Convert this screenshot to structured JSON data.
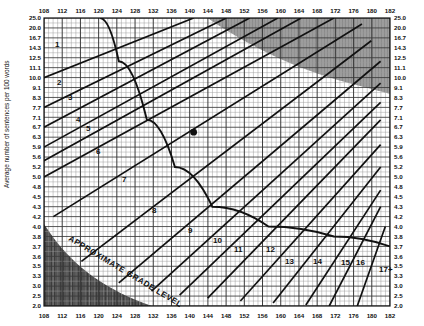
{
  "axes": {
    "y_label": "Average number of sentences per 100 words",
    "x_ticks": [
      "108",
      "112",
      "116",
      "120",
      "124",
      "128",
      "132",
      "136",
      "140",
      "144",
      "148",
      "152",
      "156",
      "160",
      "164",
      "168",
      "172",
      "176",
      "180",
      "182"
    ],
    "y_ticks": [
      "25.0",
      "20.0",
      "16.7",
      "14.3",
      "12.5",
      "11.1",
      "10.0",
      "9.1",
      "8.3",
      "7.7",
      "7.1",
      "6.7",
      "6.3",
      "5.9",
      "5.6",
      "5.2",
      "5.0",
      "4.8",
      "4.5",
      "4.3",
      "4.2",
      "4.0",
      "3.8",
      "3.7",
      "3.6",
      "3.5",
      "3.3",
      "3.0",
      "2.5",
      "2.0"
    ]
  },
  "grade_labels": [
    "1",
    "2",
    "3",
    "4",
    "5",
    "6",
    "7",
    "8",
    "9",
    "10",
    "11",
    "12",
    "13",
    "14",
    "15",
    "16",
    "17+"
  ],
  "diagonal_label": "APPROXIMATE GRADE LEVEL",
  "colors": {
    "ink": "#111111",
    "grid": "#555555",
    "grid_light": "#8d8d8d",
    "shade_top": "#8f8f8f",
    "shade_bottom": "#4a4a4a",
    "marker": "#111111",
    "background": "#ffffff"
  },
  "chart_data": {
    "type": "line",
    "xlabel": "",
    "ylabel": "Average number of sentences per 100 words",
    "xlim": [
      108,
      182
    ],
    "ylim": [
      2.0,
      25.0
    ],
    "grid": true,
    "legend": "none",
    "x_tick_values": [
      108,
      112,
      116,
      120,
      124,
      128,
      132,
      136,
      140,
      144,
      148,
      152,
      156,
      160,
      164,
      168,
      172,
      176,
      180,
      182
    ],
    "y_tick_values": [
      25.0,
      20.0,
      16.7,
      14.3,
      12.5,
      11.1,
      10.0,
      9.1,
      8.3,
      7.7,
      7.1,
      6.7,
      6.3,
      5.9,
      5.6,
      5.2,
      5.0,
      4.8,
      4.5,
      4.3,
      4.2,
      4.0,
      3.8,
      3.7,
      3.6,
      3.5,
      3.3,
      3.0,
      2.5,
      2.0
    ],
    "annotations": [
      {
        "text": "APPROXIMATE GRADE LEVEL",
        "orientation": "diagonal"
      }
    ],
    "series": [
      {
        "name": "grade-1",
        "label": "1",
        "values": [
          [
            108,
            10.0
          ],
          [
            140,
            25.0
          ]
        ]
      },
      {
        "name": "grade-2",
        "label": "2",
        "values": [
          [
            108,
            7.7
          ],
          [
            147,
            25.0
          ]
        ]
      },
      {
        "name": "grade-3",
        "label": "3",
        "values": [
          [
            108,
            6.7
          ],
          [
            152,
            25.0
          ]
        ]
      },
      {
        "name": "grade-4",
        "label": "4",
        "values": [
          [
            108,
            5.9
          ],
          [
            158,
            25.0
          ]
        ]
      },
      {
        "name": "grade-5",
        "label": "5",
        "values": [
          [
            108,
            5.45
          ],
          [
            163,
            25.0
          ]
        ]
      },
      {
        "name": "grade-6",
        "label": "6",
        "values": [
          [
            108,
            5.0
          ],
          [
            170,
            25.0
          ]
        ]
      },
      {
        "name": "grade-7",
        "label": "7",
        "values": [
          [
            110,
            4.2
          ],
          [
            176,
            22.0
          ]
        ]
      },
      {
        "name": "grade-8",
        "label": "8",
        "values": [
          [
            116,
            3.55
          ],
          [
            178,
            16.0
          ]
        ]
      },
      {
        "name": "grade-9",
        "label": "9",
        "values": [
          [
            124,
            3.1
          ],
          [
            180,
            12.0
          ]
        ]
      },
      {
        "name": "grade-10",
        "label": "10",
        "values": [
          [
            131,
            2.75
          ],
          [
            180,
            9.5
          ]
        ]
      },
      {
        "name": "grade-11",
        "label": "11",
        "values": [
          [
            137,
            2.55
          ],
          [
            180,
            8.0
          ]
        ]
      },
      {
        "name": "grade-12",
        "label": "12",
        "values": [
          [
            143,
            2.4
          ],
          [
            180,
            7.0
          ]
        ]
      },
      {
        "name": "grade-13",
        "label": "13",
        "values": [
          [
            150,
            2.25
          ],
          [
            180,
            6.0
          ]
        ]
      },
      {
        "name": "grade-14",
        "label": "14",
        "values": [
          [
            157,
            2.15
          ],
          [
            180,
            5.2
          ]
        ]
      },
      {
        "name": "grade-15",
        "label": "15",
        "values": [
          [
            164,
            2.05
          ],
          [
            180,
            4.7
          ]
        ]
      },
      {
        "name": "grade-16",
        "label": "16",
        "values": [
          [
            169,
            2.0
          ],
          [
            180,
            4.3
          ]
        ]
      },
      {
        "name": "grade-17",
        "label": "17+",
        "values": [
          [
            175,
            2.0
          ],
          [
            181,
            4.0
          ]
        ]
      }
    ],
    "boundary_curve": {
      "name": "long-word-boundary",
      "values": [
        [
          120,
          25.0
        ],
        [
          124,
          12.0
        ],
        [
          130,
          7.0
        ],
        [
          136,
          5.2
        ],
        [
          144,
          4.3
        ],
        [
          156,
          4.0
        ],
        [
          170,
          3.8
        ],
        [
          182,
          3.7
        ]
      ]
    },
    "points": [
      {
        "name": "sample-point",
        "x": 140,
        "y": 6.5
      }
    ],
    "shaded_regions": [
      {
        "name": "invalid-top-right",
        "shade": "#8f8f8f"
      },
      {
        "name": "invalid-bottom-left",
        "shade": "#4a4a4a"
      }
    ]
  }
}
